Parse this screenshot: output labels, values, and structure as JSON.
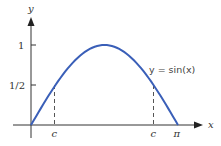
{
  "chart_data": {
    "type": "line",
    "title": "",
    "xlabel": "x",
    "ylabel": "y",
    "series": [
      {
        "name": "y = sin(x)",
        "function": "sin(x)",
        "x": [
          0,
          0.5236,
          1.0472,
          1.5708,
          2.0944,
          2.618,
          3.1416
        ],
        "values": [
          0,
          0.5,
          0.866,
          1,
          0.866,
          0.5,
          0
        ]
      }
    ],
    "xlim": [
      0,
      3.1416
    ],
    "ylim": [
      0,
      1
    ],
    "x_ticks": [
      {
        "label": "c",
        "value": 0.5236
      },
      {
        "label": "c",
        "value": 2.618
      },
      {
        "label": "π",
        "value": 3.1416
      }
    ],
    "y_ticks": [
      {
        "label": "1/2",
        "value": 0.5
      },
      {
        "label": "1",
        "value": 1
      }
    ],
    "annotations": [
      {
        "text": "y = sin(x)",
        "near_x": 2.7,
        "near_y": 0.72
      },
      {
        "type": "dashed-vertical",
        "x": 0.5236,
        "from_y": 0,
        "to_y": 0.5
      },
      {
        "type": "dashed-vertical",
        "x": 2.618,
        "from_y": 0,
        "to_y": 0.5
      }
    ],
    "grid": false,
    "legend": null,
    "curve_color": "#3a5fb8",
    "axis_color": "#333333"
  },
  "labels": {
    "y_axis": "y",
    "x_axis": "x",
    "tick_one": "1",
    "tick_half": "1/2",
    "c_left": "c",
    "c_right": "c",
    "pi": "π",
    "equation": "y = sin(x)"
  }
}
